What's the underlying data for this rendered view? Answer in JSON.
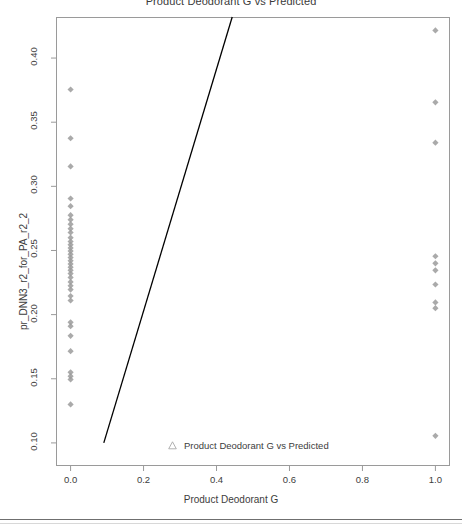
{
  "title": "Product Deodorant G vs Predicted",
  "axis": {
    "x_label": "Product Deodorant G",
    "y_label": "pr_DNN3_r2_for_PA_r2_2"
  },
  "legend": {
    "marker_icon": "triangle-marker-icon",
    "label": "Product Deodorant G vs Predicted"
  },
  "colors": {
    "point": "#9b9b9b",
    "line": "#000000",
    "frame": "#9a9a9a",
    "text": "#3d3d3d",
    "rule": "#6f6f6f"
  },
  "chart_data": {
    "type": "scatter",
    "title": "Product Deodorant G vs Predicted",
    "xlabel": "Product Deodorant G",
    "ylabel": "pr_DNN3_r2_for_PA_r2_2",
    "xlim": [
      -0.04,
      1.04
    ],
    "ylim": [
      0.082,
      0.432
    ],
    "grid": false,
    "legend_position": "bottom-center",
    "xticks": [
      0.0,
      0.2,
      0.4,
      0.6,
      0.8,
      1.0
    ],
    "xtick_labels": [
      "0.0",
      "0.2",
      "0.4",
      "0.6",
      "0.8",
      "1.0"
    ],
    "yticks": [
      0.1,
      0.15,
      0.2,
      0.25,
      0.3,
      0.35,
      0.4
    ],
    "ytick_labels": [
      "0.10",
      "0.15",
      "0.20",
      "0.25",
      "0.30",
      "0.35",
      "0.40"
    ],
    "series": [
      {
        "name": "Product Deodorant G vs Predicted",
        "marker": "diamond",
        "color": "#9b9b9b",
        "points": [
          [
            0.0,
            0.3755
          ],
          [
            0.0,
            0.3375
          ],
          [
            0.0,
            0.3155
          ],
          [
            0.0,
            0.2905
          ],
          [
            0.0,
            0.2845
          ],
          [
            0.0,
            0.2775
          ],
          [
            0.0,
            0.274
          ],
          [
            0.0,
            0.2705
          ],
          [
            0.0,
            0.267
          ],
          [
            0.0,
            0.264
          ],
          [
            0.0,
            0.26
          ],
          [
            0.0,
            0.257
          ],
          [
            0.0,
            0.2545
          ],
          [
            0.0,
            0.252
          ],
          [
            0.0,
            0.2495
          ],
          [
            0.0,
            0.247
          ],
          [
            0.0,
            0.2445
          ],
          [
            0.0,
            0.242
          ],
          [
            0.0,
            0.2395
          ],
          [
            0.0,
            0.237
          ],
          [
            0.0,
            0.2345
          ],
          [
            0.0,
            0.232
          ],
          [
            0.0,
            0.229
          ],
          [
            0.0,
            0.2255
          ],
          [
            0.0,
            0.2225
          ],
          [
            0.0,
            0.2195
          ],
          [
            0.0,
            0.2145
          ],
          [
            0.0,
            0.211
          ],
          [
            0.0,
            0.194
          ],
          [
            0.0,
            0.191
          ],
          [
            0.0,
            0.1835
          ],
          [
            0.0,
            0.1715
          ],
          [
            0.0,
            0.155
          ],
          [
            0.0,
            0.152
          ],
          [
            0.0,
            0.1495
          ],
          [
            0.0,
            0.13
          ],
          [
            1.0,
            0.4215
          ],
          [
            1.0,
            0.3655
          ],
          [
            1.0,
            0.334
          ],
          [
            1.0,
            0.2455
          ],
          [
            1.0,
            0.24
          ],
          [
            1.0,
            0.2345
          ],
          [
            1.0,
            0.2235
          ],
          [
            1.0,
            0.2095
          ],
          [
            1.0,
            0.205
          ],
          [
            1.0,
            0.1055
          ]
        ]
      }
    ],
    "fit_line": {
      "name": "regression-line",
      "color": "#000000",
      "x_at_bottom": 0.091,
      "y_at_bottom": 0.1,
      "x_at_top": 0.443,
      "y_at_top": 0.432
    }
  }
}
